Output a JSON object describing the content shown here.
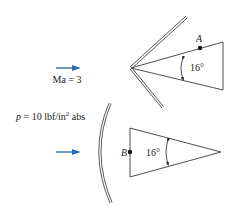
{
  "upper_case": {
    "mach_label": "Ma = 3",
    "point_label": "A",
    "angle_label": "16°",
    "shock_type": "oblique-shock"
  },
  "lower_case": {
    "pressure_label_prefix": "p",
    "pressure_label_value": " = 10 lbf/in",
    "pressure_label_exp": "2",
    "pressure_label_suffix": " abs",
    "point_label": "B",
    "angle_label": "16°",
    "shock_type": "detached-bow-shock"
  },
  "colors": {
    "flow_arrow": "#2a6db5",
    "lines": "#3a3a3a",
    "shock": "#444444"
  }
}
